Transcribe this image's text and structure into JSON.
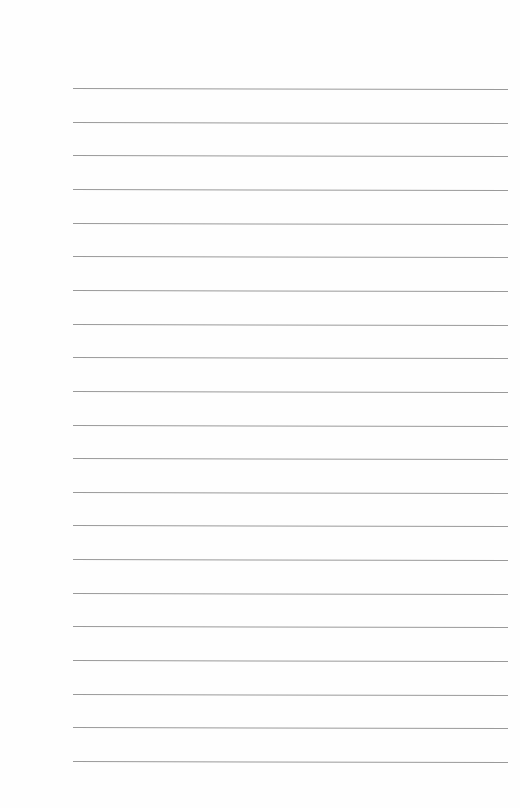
{
  "document": {
    "type": "lined-paper",
    "line_count": 21,
    "line_color": "#9a9a9a",
    "paper_color": "#fefefe",
    "text": []
  }
}
